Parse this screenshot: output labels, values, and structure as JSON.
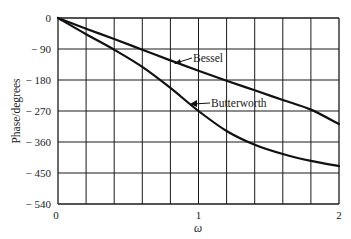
{
  "chart_data": {
    "type": "line",
    "title": "",
    "xlabel": "ω",
    "ylabel": "Phase/degrees",
    "xlim": [
      0,
      2
    ],
    "ylim": [
      -540,
      0
    ],
    "grid": true,
    "x_ticks": [
      "0",
      "1",
      "2"
    ],
    "y_ticks": [
      "0",
      "− 90",
      "− 180",
      "− 270",
      "− 360",
      "− 450",
      "− 540"
    ],
    "x": [
      0,
      0.2,
      0.4,
      0.6,
      0.8,
      1.0,
      1.2,
      1.4,
      1.6,
      1.8,
      2.0
    ],
    "series": [
      {
        "name": "Bessel",
        "values": [
          0,
          -31,
          -61,
          -92,
          -123,
          -153,
          -182,
          -210,
          -238,
          -266,
          -308
        ]
      },
      {
        "name": "Butterworth",
        "values": [
          0,
          -47,
          -92,
          -142,
          -203,
          -270,
          -328,
          -368,
          -395,
          -415,
          -430
        ]
      }
    ],
    "annotations": [
      {
        "text": "Bessel",
        "points_to": "Bessel curve near ω≈0.85"
      },
      {
        "text": "Butterworth",
        "points_to": "Butterworth curve near ω≈0.95"
      }
    ]
  }
}
